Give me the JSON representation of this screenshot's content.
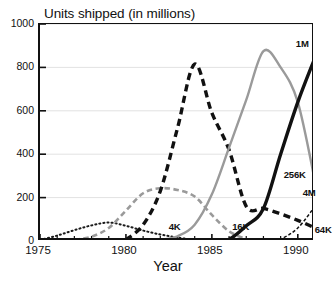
{
  "chart_data": {
    "type": "line",
    "title": "Units shipped (in millions)",
    "xlabel": "Year",
    "ylabel": "",
    "xlim": [
      1975,
      1991
    ],
    "ylim": [
      0,
      1000
    ],
    "grid": true,
    "legend_position": "inline-annotations",
    "x_ticks_major": [
      1975,
      1980,
      1985,
      1990
    ],
    "x_ticks_minor_step": 1,
    "y_ticks": [
      0,
      200,
      400,
      600,
      800,
      1000
    ],
    "series": [
      {
        "name": "4K",
        "style": "dotted",
        "color": "#1a1a1a",
        "width": 2.0,
        "label_x": 1982.6,
        "label_y": 62,
        "x": [
          1975,
          1976,
          1977,
          1978,
          1979,
          1980,
          1981,
          1982,
          1983,
          1984
        ],
        "values": [
          5,
          25,
          50,
          72,
          85,
          70,
          48,
          30,
          16,
          5
        ]
      },
      {
        "name": "16K",
        "style": "dashed",
        "color": "#9a9a9a",
        "width": 2.6,
        "label_x": 1986.3,
        "label_y": 62,
        "x": [
          1977,
          1978,
          1979,
          1980,
          1981,
          1982,
          1983,
          1984,
          1985,
          1986,
          1987
        ],
        "values": [
          5,
          20,
          60,
          140,
          220,
          243,
          235,
          205,
          120,
          45,
          8
        ]
      },
      {
        "name": "64K",
        "style": "dashed",
        "color": "#111111",
        "width": 3.4,
        "label_x": 1991.1,
        "label_y": 48,
        "x": [
          1980,
          1981,
          1982,
          1983,
          1984,
          1985,
          1986,
          1987,
          1988,
          1989,
          1990,
          1991
        ],
        "values": [
          5,
          75,
          230,
          520,
          815,
          590,
          420,
          160,
          150,
          125,
          95,
          60
        ]
      },
      {
        "name": "256K",
        "style": "solid",
        "color": "#9a9a9a",
        "width": 2.4,
        "label_x": 1989.3,
        "label_y": 300,
        "x": [
          1982,
          1983,
          1984,
          1985,
          1986,
          1987,
          1988,
          1989,
          1990,
          1991
        ],
        "values": [
          5,
          22,
          75,
          215,
          430,
          650,
          875,
          800,
          640,
          275
        ]
      },
      {
        "name": "1M",
        "style": "solid",
        "color": "#111111",
        "width": 3.4,
        "label_x": 1990.0,
        "label_y": 905,
        "x": [
          1985,
          1986,
          1987,
          1988,
          1989,
          1990,
          1991
        ],
        "values": [
          2,
          8,
          70,
          150,
          400,
          640,
          845
        ]
      },
      {
        "name": "4M",
        "style": "dashed",
        "color": "#111111",
        "width": 1.5,
        "label_x": 1990.4,
        "label_y": 215,
        "x": [
          1988,
          1989,
          1990,
          1991
        ],
        "values": [
          2,
          10,
          60,
          160
        ]
      }
    ]
  }
}
